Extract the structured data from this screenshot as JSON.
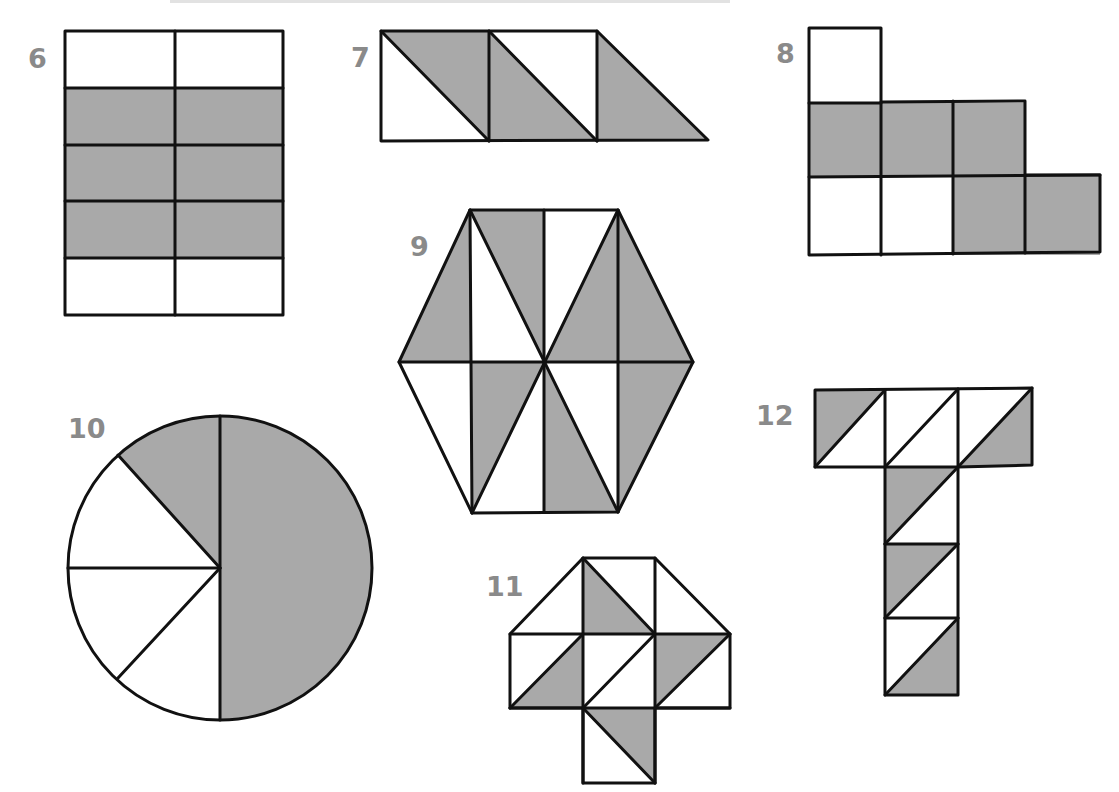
{
  "page": {
    "background": "#ffffff",
    "shade_color": "#a9a9a9",
    "line_color": "#111111",
    "label_color": "#8a8a8a"
  },
  "figures": [
    {
      "id": "6",
      "label": "6",
      "shape": "rectangle grid 2 columns x 5 rows",
      "total_parts": 10,
      "shaded_parts": 6
    },
    {
      "id": "7",
      "label": "7",
      "shape": "strip of triangles (squares split diagonally)",
      "total_parts": 5,
      "shaded_parts": 3
    },
    {
      "id": "8",
      "label": "8",
      "shape": "L-shaped arrangement of squares",
      "total_parts": 9,
      "shaded_parts": 5
    },
    {
      "id": "9",
      "label": "9",
      "shape": "hexagon divided into triangles",
      "total_parts": 12,
      "shaded_parts": 6
    },
    {
      "id": "10",
      "label": "10",
      "shape": "circle divided into sectors",
      "total_parts": 8,
      "shaded_parts": 5
    },
    {
      "id": "11",
      "label": "11",
      "shape": "cross of squares and triangles split diagonally",
      "total_parts": 12,
      "shaded_parts": 4
    },
    {
      "id": "12",
      "label": "12",
      "shape": "T-shape of squares split diagonally",
      "total_parts": 12,
      "shaded_parts": 5
    }
  ]
}
